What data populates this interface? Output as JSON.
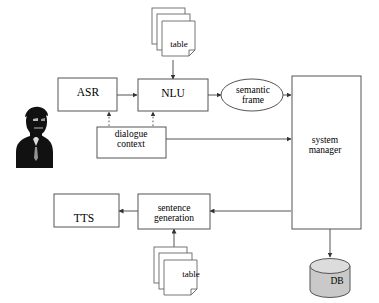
{
  "diagram": {
    "colors": {
      "stroke": "#555555",
      "text": "#000000",
      "background": "#ffffff",
      "db_fill": "#c9c9c9",
      "db_top_fill": "#d8d8d8",
      "page_fill": "#ffffff"
    },
    "nodes": [
      {
        "id": "user",
        "label": "",
        "shape": "person-silhouette"
      },
      {
        "id": "asr",
        "label": "ASR",
        "shape": "rectangle"
      },
      {
        "id": "nlu",
        "label": "NLU",
        "shape": "rectangle"
      },
      {
        "id": "semantic",
        "label": "semantic\nframe",
        "shape": "ellipse"
      },
      {
        "id": "sysmgr",
        "label": "system\nmanager",
        "shape": "rectangle"
      },
      {
        "id": "dialogue",
        "label": "dialogue\ncontext",
        "shape": "rectangle"
      },
      {
        "id": "tts",
        "label": "TTS",
        "shape": "rectangle"
      },
      {
        "id": "sentgen",
        "label": "sentence\ngeneration",
        "shape": "rectangle"
      },
      {
        "id": "table_top",
        "label": "table",
        "shape": "document-stack"
      },
      {
        "id": "table_bot",
        "label": "table",
        "shape": "document-stack"
      },
      {
        "id": "db",
        "label": "DB",
        "shape": "cylinder"
      }
    ],
    "edges": [
      {
        "from": "asr",
        "to": "nlu",
        "style": "solid",
        "arrows": "forward"
      },
      {
        "from": "nlu",
        "to": "semantic",
        "style": "solid",
        "arrows": "forward"
      },
      {
        "from": "semantic",
        "to": "sysmgr",
        "style": "solid",
        "arrows": "forward"
      },
      {
        "from": "table_top",
        "to": "nlu",
        "style": "solid",
        "arrows": "forward"
      },
      {
        "from": "dialogue",
        "to": "asr",
        "style": "dotted",
        "arrows": "forward"
      },
      {
        "from": "dialogue",
        "to": "nlu",
        "style": "dotted",
        "arrows": "forward"
      },
      {
        "from": "dialogue",
        "to": "sysmgr",
        "style": "solid",
        "arrows": "both"
      },
      {
        "from": "sysmgr",
        "to": "sentgen",
        "style": "solid",
        "arrows": "forward"
      },
      {
        "from": "sentgen",
        "to": "tts",
        "style": "solid",
        "arrows": "forward"
      },
      {
        "from": "table_bot",
        "to": "sentgen",
        "style": "solid",
        "arrows": "forward"
      },
      {
        "from": "sysmgr",
        "to": "db",
        "style": "solid",
        "arrows": "both"
      }
    ]
  }
}
